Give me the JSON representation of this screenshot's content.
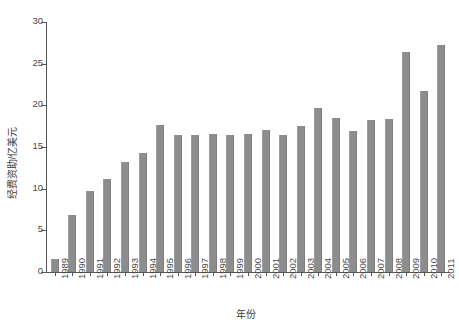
{
  "chart_data": {
    "type": "bar",
    "title": "",
    "xlabel": "年份",
    "ylabel": "经费资助/亿美元",
    "ylim": [
      0,
      30
    ],
    "yticks": [
      0,
      5,
      10,
      15,
      20,
      25,
      30
    ],
    "grid": false,
    "legend": null,
    "bar_color": "#8d8d8d",
    "axis_color": "#555555",
    "categories": [
      "1989",
      "1990",
      "1991",
      "1992",
      "1993",
      "1994",
      "1995",
      "1996",
      "1997",
      "1998",
      "1999",
      "2000",
      "2001",
      "2002",
      "2003",
      "2004",
      "2005",
      "2006",
      "2007",
      "2008",
      "2009",
      "2010",
      "2011"
    ],
    "values": [
      1.6,
      6.8,
      9.7,
      11.2,
      13.2,
      14.3,
      17.6,
      16.5,
      16.4,
      16.6,
      16.5,
      16.6,
      17.1,
      16.5,
      17.5,
      19.7,
      18.5,
      16.9,
      18.3,
      18.4,
      26.4,
      21.7,
      27.2
    ]
  }
}
